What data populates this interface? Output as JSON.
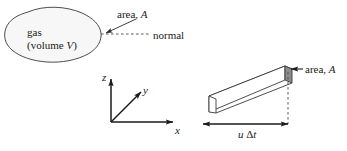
{
  "figure": {
    "background": "#ffffff",
    "ink_color": "#1a1a1a",
    "blob_fill": "#f7f7f7",
    "face_fill": "#8c8c8c",
    "prism_fill": "#ffffff"
  },
  "gas_region": {
    "label_line1": "gas",
    "label_line2_prefix": "(volume ",
    "label_line2_var": "V",
    "label_line2_suffix": ")",
    "shape_name": "irregular-blob"
  },
  "annotations": {
    "area_left_prefix": "area, ",
    "area_left_var": "A",
    "normal_label": "normal",
    "area_right_prefix": "area, ",
    "area_right_var": "A"
  },
  "axes": {
    "z_label": "z",
    "y_label": "y",
    "x_label": "x"
  },
  "prism": {
    "dimension_var_u": "u",
    "dimension_delta": "Δ",
    "dimension_var_t": "t",
    "dimension_label": "u Δt"
  }
}
